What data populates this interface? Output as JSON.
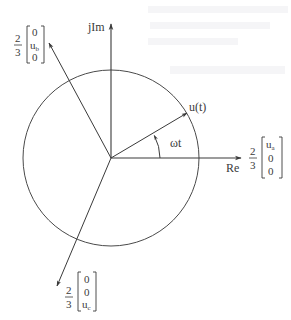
{
  "figure": {
    "type": "space-vector phasor diagram",
    "background": "#ffffff",
    "ink_color": "#3a3a3a",
    "origin": {
      "x": 111,
      "y": 158
    },
    "circle": {
      "cx": 111,
      "cy": 158,
      "r": 88
    }
  },
  "axes": {
    "real": {
      "label": "Re",
      "tip": {
        "x": 241,
        "y": 158
      }
    },
    "imag": {
      "label": "jIm",
      "tip": {
        "x": 111,
        "y": 24
      }
    }
  },
  "vectors": {
    "u_t": {
      "label": "u(t)",
      "tip": {
        "x": 187,
        "y": 113
      }
    },
    "a": {
      "fraction_num": "2",
      "fraction_den": "3",
      "entries": [
        "u",
        "0",
        "0"
      ],
      "subscript": "a",
      "tip": {
        "x": 241,
        "y": 158
      }
    },
    "b": {
      "fraction_num": "2",
      "fraction_den": "3",
      "entries": [
        "0",
        "u",
        "0"
      ],
      "subscript": "b",
      "tip": {
        "x": 49,
        "y": 43
      }
    },
    "c": {
      "fraction_num": "2",
      "fraction_den": "3",
      "entries": [
        "0",
        "0",
        "u"
      ],
      "subscript": "c",
      "tip": {
        "x": 57,
        "y": 286
      }
    }
  },
  "angle": {
    "label": "ωt"
  }
}
